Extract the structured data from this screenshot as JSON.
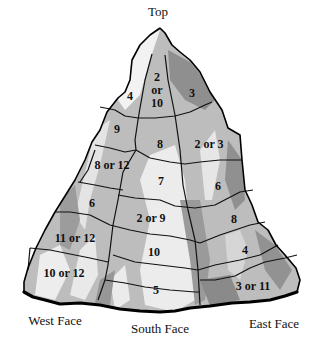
{
  "diagram": {
    "type": "mountain-region-map",
    "labels": {
      "top": "Top",
      "west_face": "West Face",
      "south_face": "South Face",
      "east_face": "East Face"
    },
    "regions": [
      {
        "id": "r1",
        "label": "2",
        "label2": "or",
        "label3": "10",
        "face": "south"
      },
      {
        "id": "r2",
        "label": "4",
        "face": "west"
      },
      {
        "id": "r3",
        "label": "3",
        "face": "east"
      },
      {
        "id": "r4",
        "label": "9",
        "face": "west"
      },
      {
        "id": "r5",
        "label": "8",
        "face": "south"
      },
      {
        "id": "r6",
        "label": "2 or 3",
        "face": "east"
      },
      {
        "id": "r7",
        "label": "8 or 12",
        "face": "west"
      },
      {
        "id": "r8",
        "label": "7",
        "face": "south"
      },
      {
        "id": "r9",
        "label": "6",
        "face": "east"
      },
      {
        "id": "r10",
        "label": "6",
        "face": "west"
      },
      {
        "id": "r11",
        "label": "2 or 9",
        "face": "south"
      },
      {
        "id": "r12",
        "label": "8",
        "face": "east"
      },
      {
        "id": "r13",
        "label": "11 or 12",
        "face": "west"
      },
      {
        "id": "r14",
        "label": "10",
        "face": "south"
      },
      {
        "id": "r15",
        "label": "4",
        "face": "east"
      },
      {
        "id": "r16",
        "label": "10 or 12",
        "face": "west"
      },
      {
        "id": "r17",
        "label": "5",
        "face": "south"
      },
      {
        "id": "r18",
        "label": "3 or 11",
        "face": "east"
      }
    ],
    "colors": {
      "light": "#e8e8e8",
      "mid": "#b4b4b4",
      "dark": "#8c8c8c",
      "outline": "#000000"
    }
  }
}
